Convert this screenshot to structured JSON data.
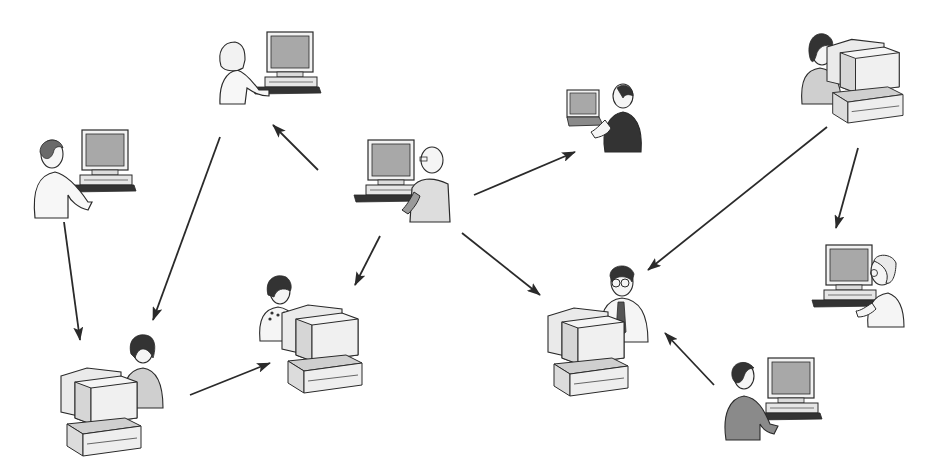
{
  "diagram": {
    "type": "network",
    "colors": {
      "background": "#ffffff",
      "line": "#2a2a2a",
      "screen": "#a8a8a8",
      "body_light": "#f4f4f4",
      "body_gray": "#bcbcbc",
      "body_dark": "#333333",
      "hair": "#3a3a3a"
    },
    "nodes": [
      {
        "id": "n1",
        "label": "man-standing-desktop-left",
        "x": 30,
        "y": 130
      },
      {
        "id": "n2",
        "label": "woman-standing-desktop-top",
        "x": 215,
        "y": 32
      },
      {
        "id": "n3",
        "label": "bald-man-desktop-center",
        "x": 352,
        "y": 140
      },
      {
        "id": "n4",
        "label": "man-laptop-dark-vest",
        "x": 565,
        "y": 80
      },
      {
        "id": "n5",
        "label": "woman-crt-top-right",
        "x": 800,
        "y": 32
      },
      {
        "id": "n6",
        "label": "woman-crt-bottom-left",
        "x": 65,
        "y": 332
      },
      {
        "id": "n7",
        "label": "woman-crt-necklace-center",
        "x": 258,
        "y": 275
      },
      {
        "id": "n8",
        "label": "man-glasses-tie-crt",
        "x": 540,
        "y": 262
      },
      {
        "id": "n9",
        "label": "man-glasses-desktop-right",
        "x": 812,
        "y": 245
      },
      {
        "id": "n10",
        "label": "man-dark-suit-desktop-bottom",
        "x": 722,
        "y": 358
      }
    ],
    "edges": [
      {
        "from": "n3",
        "to": "n2",
        "x1": 318,
        "y1": 170,
        "x2": 273,
        "y2": 125
      },
      {
        "from": "n3",
        "to": "n4",
        "x1": 474,
        "y1": 195,
        "x2": 575,
        "y2": 152
      },
      {
        "from": "n3",
        "to": "n7",
        "x1": 380,
        "y1": 236,
        "x2": 355,
        "y2": 285
      },
      {
        "from": "n3",
        "to": "n8",
        "x1": 462,
        "y1": 233,
        "x2": 540,
        "y2": 295
      },
      {
        "from": "n2",
        "to": "n6",
        "x1": 220,
        "y1": 137,
        "x2": 153,
        "y2": 320
      },
      {
        "from": "n1",
        "to": "n6",
        "x1": 64,
        "y1": 222,
        "x2": 80,
        "y2": 340
      },
      {
        "from": "n6",
        "to": "n7",
        "x1": 190,
        "y1": 395,
        "x2": 270,
        "y2": 363
      },
      {
        "from": "n5",
        "to": "n8",
        "x1": 827,
        "y1": 127,
        "x2": 648,
        "y2": 270
      },
      {
        "from": "n5",
        "to": "n9",
        "x1": 858,
        "y1": 148,
        "x2": 836,
        "y2": 228
      },
      {
        "from": "n10",
        "to": "n8",
        "x1": 714,
        "y1": 385,
        "x2": 665,
        "y2": 333
      }
    ]
  }
}
